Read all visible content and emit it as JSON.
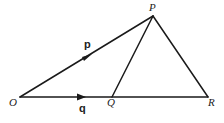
{
  "diagram": {
    "type": "vector-geometry",
    "points": {
      "O": {
        "label": "O",
        "x": 20,
        "y": 97
      },
      "P": {
        "label": "P",
        "x": 153,
        "y": 16
      },
      "Q": {
        "label": "Q",
        "x": 112,
        "y": 97
      },
      "R": {
        "label": "R",
        "x": 208,
        "y": 97
      }
    },
    "edges": [
      {
        "from": "O",
        "to": "P",
        "arrow": true,
        "vector_label": "p"
      },
      {
        "from": "O",
        "to": "Q",
        "arrow": true,
        "vector_label": "q"
      },
      {
        "from": "Q",
        "to": "R",
        "arrow": false
      },
      {
        "from": "P",
        "to": "Q",
        "arrow": false
      },
      {
        "from": "P",
        "to": "R",
        "arrow": false
      }
    ],
    "labels": {
      "O": "O",
      "P": "P",
      "Q": "Q",
      "R": "R",
      "p": "p",
      "q": "q"
    }
  }
}
